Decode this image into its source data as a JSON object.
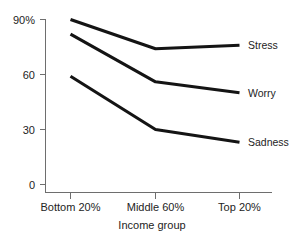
{
  "chart_data": {
    "type": "line",
    "title": "",
    "xlabel": "Income group",
    "ylabel": "",
    "categories": [
      "Bottom 20%",
      "Middle 60%",
      "Top 20%"
    ],
    "series": [
      {
        "name": "Stress",
        "values": [
          90,
          74,
          76
        ]
      },
      {
        "name": "Worry",
        "values": [
          82,
          56,
          50
        ]
      },
      {
        "name": "Sadness",
        "values": [
          59,
          30,
          23
        ]
      }
    ],
    "ylim": [
      0,
      95
    ],
    "yticks": [
      0,
      30,
      60,
      90
    ],
    "ytick_labels": [
      "0",
      "30",
      "60",
      "90%"
    ],
    "grid": false,
    "legend_position": "right-inline-end-of-line"
  },
  "axis": {
    "y_labels": [
      "90%",
      "60",
      "30",
      "0"
    ],
    "x_labels": [
      "Bottom 20%",
      "Middle 60%",
      "Top 20%"
    ],
    "x_title": "Income group"
  },
  "series_labels": {
    "stress": "Stress",
    "worry": "Worry",
    "sadness": "Sadness"
  },
  "colors": {
    "line": "#141414",
    "axis": "#6e6e6e",
    "text": "#232323",
    "background": "#ffffff"
  }
}
